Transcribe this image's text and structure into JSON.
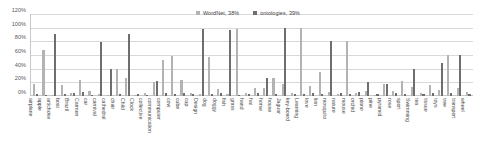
{
  "chart_data": {
    "type": "bar",
    "title": "",
    "subtitle": "",
    "xlabel": "",
    "ylabel": "",
    "ylim": [
      0,
      120
    ],
    "grid": true,
    "legend_position": "top-right",
    "y_ticks": [
      "0%",
      "20%",
      "40%",
      "60%",
      "80%",
      "100%",
      "120%"
    ],
    "y_tick_values": [
      0,
      20,
      40,
      60,
      80,
      100,
      120
    ],
    "legend": [
      {
        "name": "WordNet",
        "label": "WordNet,  38%",
        "average": 38,
        "color": "#b3b3b3"
      },
      {
        "name": "ontologies",
        "label": "ontologies,  39%",
        "average": 39,
        "color": "#6e6e6e"
      }
    ],
    "categories": [
      "airplane",
      "apple",
      "artichoke",
      "boat",
      "Brazil",
      "Carmen",
      "car",
      "carnival",
      "cathedral",
      "chair",
      "Child",
      "Clock",
      "collective",
      "communication",
      "computer",
      "cow",
      "cube",
      "cup",
      "Design",
      "dog",
      "doggy",
      "fish",
      "grass",
      "hand",
      "hat",
      "horse",
      "house",
      "Jaguar",
      "key-board",
      "Learning",
      "love",
      "lion",
      "mosquito",
      "nature",
      "mouse",
      "orchid",
      "piano",
      "pine",
      "pyramid",
      "rose",
      "sport",
      "Swimming",
      "tea",
      "tissue",
      "toys",
      "tree",
      "transport",
      "wheel"
    ],
    "series": [
      {
        "name": "WordNet",
        "color": "#b3b3b3",
        "values": [
          17,
          67,
          2,
          16,
          5,
          23,
          8,
          3,
          2,
          40,
          27,
          2,
          4,
          20,
          52,
          58,
          23,
          4,
          3,
          57,
          10,
          3,
          98,
          5,
          12,
          11,
          27,
          17,
          4,
          100,
          14,
          35,
          6,
          3,
          80,
          5,
          8,
          2,
          18,
          7,
          22,
          13,
          5,
          16,
          9,
          60,
          12,
          6
        ]
      },
      {
        "name": "ontologies",
        "color": "#6e6e6e",
        "values": [
          3,
          2,
          91,
          3,
          4,
          6,
          2,
          79,
          39,
          3,
          91,
          3,
          2,
          22,
          4,
          3,
          4,
          3,
          98,
          3,
          4,
          97,
          2,
          3,
          4,
          26,
          3,
          100,
          3,
          3,
          4,
          3,
          80,
          4,
          3,
          6,
          20,
          3,
          17,
          4,
          3,
          39,
          3,
          4,
          48,
          4,
          60,
          3
        ]
      }
    ]
  }
}
